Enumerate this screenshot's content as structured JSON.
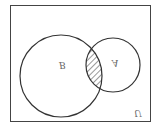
{
  "diagram": {
    "type": "venn",
    "universe_label": "U",
    "sets": [
      {
        "name": "B",
        "label": "B",
        "cx": 61,
        "cy": 65,
        "r": 41
      },
      {
        "name": "A",
        "label": "A",
        "cx": 113,
        "cy": 55,
        "r": 27
      }
    ],
    "shaded_region": "A ∩ B",
    "orientation": "flipped-vertical",
    "colors": {
      "stroke": "#333333",
      "background": "#ffffff",
      "hatch": "#333333",
      "label": "#666666"
    }
  }
}
